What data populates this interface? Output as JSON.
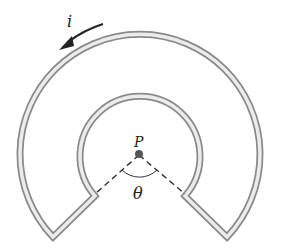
{
  "diagram": {
    "type": "current-loop-sector",
    "labels": {
      "current": "i",
      "point": "P",
      "angle": "θ"
    },
    "geometry": {
      "center": [
        139,
        153
      ],
      "outer_radius": 120,
      "inner_radius": 60,
      "gap_angle_label": "θ"
    },
    "colors": {
      "wire": "#8a8a8a",
      "wire_highlight": "#e6e6e6",
      "dashed": "#333333",
      "point": "#555555",
      "arrow": "#222222"
    }
  }
}
